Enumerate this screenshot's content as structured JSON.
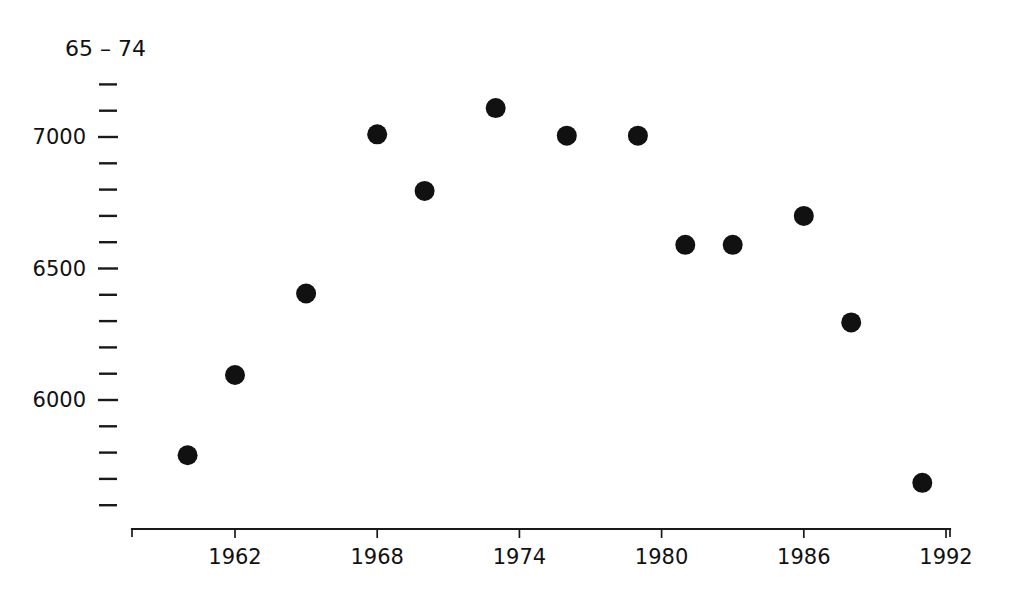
{
  "chart_data": {
    "type": "scatter",
    "title": "",
    "ylabel": "65 – 74",
    "xlabel": "",
    "x": [
      1960,
      1962,
      1965,
      1968,
      1970,
      1973,
      1976,
      1979,
      1981,
      1983,
      1986,
      1988,
      1991
    ],
    "values": [
      5790,
      6095,
      6405,
      7010,
      6795,
      7110,
      7005,
      7005,
      6590,
      6590,
      6700,
      6295,
      5685
    ],
    "series": [
      {
        "name": "65 – 74",
        "points": [
          {
            "x": 1960,
            "y": 5790
          },
          {
            "x": 1962,
            "y": 6095
          },
          {
            "x": 1965,
            "y": 6405
          },
          {
            "x": 1968,
            "y": 7010
          },
          {
            "x": 1970,
            "y": 6795
          },
          {
            "x": 1973,
            "y": 7110
          },
          {
            "x": 1976,
            "y": 7005
          },
          {
            "x": 1979,
            "y": 7005
          },
          {
            "x": 1981,
            "y": 6590
          },
          {
            "x": 1983,
            "y": 6590
          },
          {
            "x": 1986,
            "y": 6700
          },
          {
            "x": 1988,
            "y": 6295
          },
          {
            "x": 1991,
            "y": 5685
          }
        ]
      }
    ],
    "xlim": [
      1959,
      1992
    ],
    "ylim": [
      5600,
      7200
    ],
    "xticks": [
      1962,
      1968,
      1974,
      1980,
      1986,
      1992
    ],
    "xtick_labels": [
      "1962",
      "1968",
      "1974",
      "1980",
      "1986",
      "1992"
    ],
    "yticks": [
      5600,
      5700,
      5800,
      5900,
      6000,
      6100,
      6200,
      6300,
      6400,
      6500,
      6600,
      6700,
      6800,
      6900,
      7000,
      7100,
      7200
    ],
    "ytick_labels": [
      "",
      "",
      "",
      "",
      "6000",
      "",
      "",
      "",
      "",
      "6500",
      "",
      "",
      "",
      "",
      "7000",
      "",
      ""
    ],
    "ylabeled_ticks": [
      {
        "value": 7000,
        "label": "7000"
      },
      {
        "value": 6500,
        "label": "6500"
      },
      {
        "value": 6000,
        "label": "6000"
      }
    ],
    "grid": false,
    "legend": "none",
    "marker": "filled-circle",
    "marker_color": "#111111",
    "marker_size_px": 20,
    "axis_color": "#1a1a1a"
  }
}
